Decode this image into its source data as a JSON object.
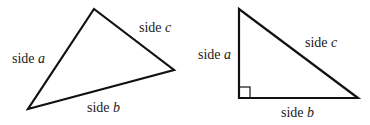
{
  "diagram": {
    "colors": {
      "stroke": "#111111",
      "text": "#1a1a1a",
      "background": "#ffffff"
    },
    "triangles": [
      {
        "name": "general-triangle",
        "vertices": [
          [
            94,
            9
          ],
          [
            28,
            109
          ],
          [
            174,
            70
          ]
        ],
        "labels": {
          "a": {
            "prefix": "side",
            "var": "a"
          },
          "b": {
            "prefix": "side",
            "var": "b"
          },
          "c": {
            "prefix": "side",
            "var": "c"
          }
        }
      },
      {
        "name": "right-triangle",
        "vertices": [
          [
            239,
            9
          ],
          [
            239,
            98
          ],
          [
            358,
            98
          ]
        ],
        "right_angle_at": [
          239,
          98
        ],
        "labels": {
          "a": {
            "prefix": "side",
            "var": "a"
          },
          "b": {
            "prefix": "side",
            "var": "b"
          },
          "c": {
            "prefix": "side",
            "var": "c"
          }
        }
      }
    ]
  }
}
